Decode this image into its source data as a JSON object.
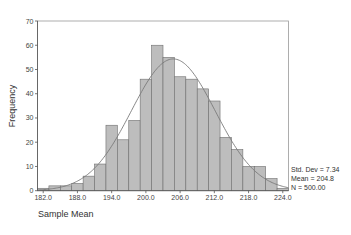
{
  "chart_data": {
    "type": "bar",
    "subtype": "histogram",
    "title": "",
    "xlabel": "Sample Mean",
    "ylabel": "Frequency",
    "bin_width": 2.0,
    "categories": [
      "182.0",
      "184.0",
      "186.0",
      "188.0",
      "190.0",
      "192.0",
      "194.0",
      "196.0",
      "198.0",
      "200.0",
      "202.0",
      "204.0",
      "206.0",
      "208.0",
      "210.0",
      "212.0",
      "214.0",
      "216.0",
      "218.0",
      "220.0",
      "222.0",
      "224.0"
    ],
    "bin_centers": [
      182,
      184,
      186,
      188,
      190,
      192,
      194,
      196,
      198,
      200,
      202,
      204,
      206,
      208,
      210,
      212,
      214,
      216,
      218,
      220,
      222,
      224
    ],
    "values": [
      1,
      2,
      2,
      3,
      6,
      11,
      27,
      21,
      29,
      46,
      60,
      55,
      47,
      46,
      42,
      37,
      22,
      17,
      10,
      10,
      5,
      1
    ],
    "xlim": [
      181,
      225
    ],
    "ylim": [
      0,
      70
    ],
    "xticks": [
      "182.0",
      "188.0",
      "194.0",
      "200.0",
      "206.0",
      "212.0",
      "218.0",
      "224.0"
    ],
    "xtick_values": [
      182,
      188,
      194,
      200,
      206,
      212,
      218,
      224
    ],
    "yticks": [
      "0",
      "10",
      "20",
      "30",
      "40",
      "50",
      "60",
      "70"
    ],
    "ytick_values": [
      0,
      10,
      20,
      30,
      40,
      50,
      60,
      70
    ],
    "overlay": {
      "type": "normal_curve",
      "mean": 204.8,
      "std_dev": 7.34,
      "n": 500
    },
    "annotations": [
      "Std. Dev = 7.34",
      "Mean = 204.8",
      "N = 500.00"
    ],
    "grid": false,
    "legend": "none"
  },
  "labels": {
    "xlabel": "Sample Mean",
    "ylabel": "Frequency",
    "stats": {
      "std_dev": "Std. Dev = 7.34",
      "mean": "Mean = 204.8",
      "n": "N = 500.00"
    }
  },
  "colors": {
    "bar_fill": "#bdbdbd",
    "bar_stroke": "#6f6f6f",
    "curve": "#7a7a7a",
    "frame": "#9a9a9a"
  }
}
